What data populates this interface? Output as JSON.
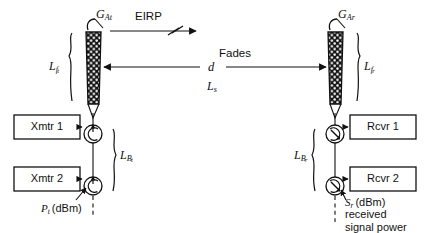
{
  "diagram": {
    "background_color": "#ffffff",
    "line_color": "#111111",
    "canvas": {
      "width": 430,
      "height": 233
    }
  },
  "transmit_side": {
    "antenna_gain_label": "G",
    "antenna_gain_sub": "At",
    "eirp_label": "EIRP",
    "feedline_loss_label": "L",
    "feedline_loss_sub": "f",
    "feedline_loss_sub2": "t",
    "branching_loss_label": "L",
    "branching_loss_sub": "B",
    "branching_loss_sub2": "t",
    "transmitters": [
      {
        "label": "Xmtr 1"
      },
      {
        "label": "Xmtr 2"
      }
    ],
    "power_label": "P",
    "power_sub": "t",
    "power_units": "(dBm)"
  },
  "path": {
    "fades_label": "Fades",
    "distance_label": "d",
    "path_loss_label": "L",
    "path_loss_sub": "s"
  },
  "receive_side": {
    "antenna_gain_label": "G",
    "antenna_gain_sub": "Ar",
    "feedline_loss_label": "L",
    "feedline_loss_sub": "f",
    "feedline_loss_sub2": "r",
    "branching_loss_label": "L",
    "branching_loss_sub": "B",
    "branching_loss_sub2": "r",
    "receivers": [
      {
        "label": "Rcvr 1"
      },
      {
        "label": "Rcvr 2"
      }
    ],
    "signal_label": "S",
    "signal_sub": "r",
    "signal_units": "(dBm)",
    "signal_desc_line1": "received",
    "signal_desc_line2": "signal power"
  }
}
